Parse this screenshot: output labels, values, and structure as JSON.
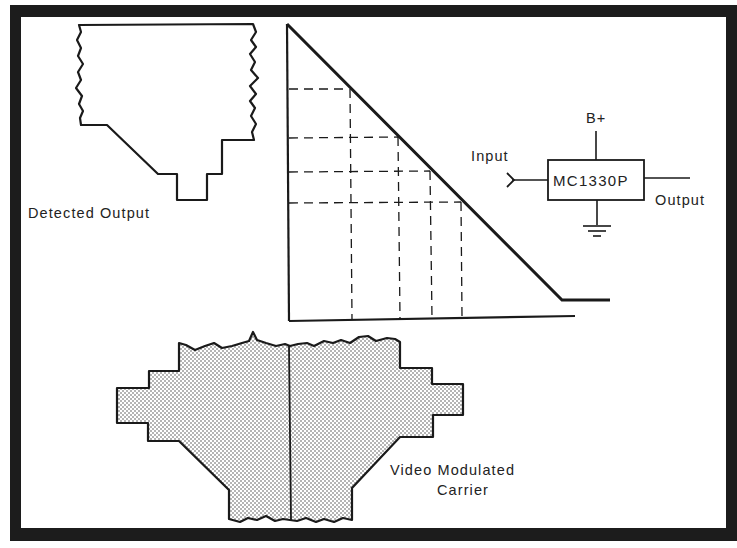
{
  "figure": {
    "background": "#ffffff",
    "frame_color": "#1c1c1c",
    "line_color": "#1a1a1a"
  },
  "detected_output": {
    "label": "Detected Output"
  },
  "transfer_graph": {
    "description": "Linear gain-vs-input transfer characteristic with dashed projection lines",
    "dashed_levels_count": 4
  },
  "circuit": {
    "ic_label": "MC1330P",
    "supply_label": "B+",
    "input_label": "Input",
    "output_label": "Output",
    "ground_symbol": "ground-icon"
  },
  "video_carrier": {
    "label_line1": "Video Modulated",
    "label_line2": "Carrier"
  }
}
